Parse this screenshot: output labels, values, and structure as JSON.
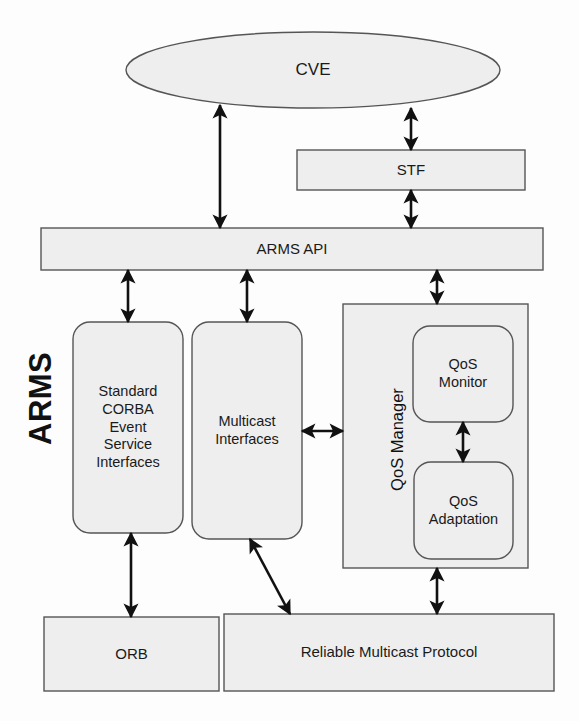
{
  "diagram": {
    "system_label": "ARMS",
    "colors": {
      "fill": "#eeeeee",
      "stroke": "#555555",
      "arrow": "#111111",
      "text": "#1a1a1a",
      "background": "#fdfdfd"
    },
    "nodes": {
      "cve": {
        "label": "CVE",
        "shape": "ellipse"
      },
      "stf": {
        "label": "STF",
        "shape": "rectangle"
      },
      "arms_api": {
        "label": "ARMS API",
        "shape": "rectangle"
      },
      "corba": {
        "label": "Standard\nCORBA\nEvent\nService\nInterfaces",
        "shape": "rounded-rectangle"
      },
      "multicast": {
        "label": "Multicast\nInterfaces",
        "shape": "rounded-rectangle"
      },
      "qos_manager": {
        "label": "QoS Manager",
        "shape": "rectangle",
        "orientation": "vertical"
      },
      "qos_monitor": {
        "label": "QoS\nMonitor",
        "shape": "rounded-rectangle"
      },
      "qos_adaptation": {
        "label": "QoS\nAdaptation",
        "shape": "rounded-rectangle"
      },
      "orb": {
        "label": "ORB",
        "shape": "rectangle"
      },
      "rmp": {
        "label": "Reliable Multicast Protocol",
        "shape": "rectangle"
      }
    },
    "connections": [
      {
        "from": "cve",
        "to": "arms_api",
        "style": "double-arrow",
        "orientation": "vertical"
      },
      {
        "from": "cve",
        "to": "stf",
        "style": "double-arrow",
        "orientation": "vertical"
      },
      {
        "from": "stf",
        "to": "arms_api",
        "style": "double-arrow",
        "orientation": "vertical"
      },
      {
        "from": "arms_api",
        "to": "corba",
        "style": "double-arrow",
        "orientation": "vertical"
      },
      {
        "from": "arms_api",
        "to": "multicast",
        "style": "double-arrow",
        "orientation": "vertical"
      },
      {
        "from": "arms_api",
        "to": "qos_manager",
        "style": "double-arrow",
        "orientation": "vertical"
      },
      {
        "from": "multicast",
        "to": "qos_manager",
        "style": "double-arrow",
        "orientation": "horizontal"
      },
      {
        "from": "qos_monitor",
        "to": "qos_adaptation",
        "style": "double-arrow",
        "orientation": "vertical"
      },
      {
        "from": "corba",
        "to": "orb",
        "style": "double-arrow",
        "orientation": "vertical"
      },
      {
        "from": "multicast",
        "to": "rmp",
        "style": "double-arrow",
        "orientation": "diagonal"
      },
      {
        "from": "qos_manager",
        "to": "rmp",
        "style": "double-arrow",
        "orientation": "vertical"
      }
    ]
  }
}
